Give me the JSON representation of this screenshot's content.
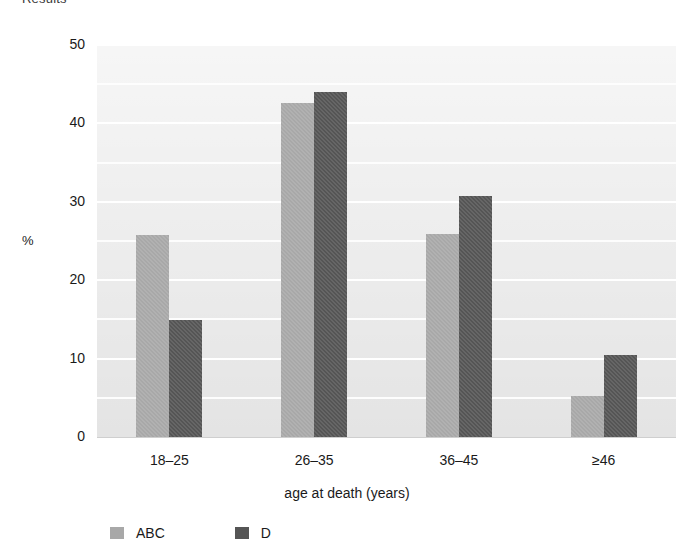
{
  "figure": {
    "heading": "Results"
  },
  "chart_data": {
    "type": "bar",
    "title": "",
    "categories": [
      "18–25",
      "26–35",
      "36–45",
      "≥46"
    ],
    "series": [
      {
        "name": "ABC",
        "color": "#a8a8a8",
        "values": [
          25.8,
          42.6,
          25.9,
          5.2
        ]
      },
      {
        "name": "D",
        "color": "#555555",
        "values": [
          14.9,
          44.0,
          30.7,
          10.5
        ]
      }
    ],
    "xlabel": "age at death (years)",
    "ylabel": "%",
    "ylim": [
      0,
      50
    ],
    "yticks": [
      0,
      10,
      20,
      30,
      40,
      50
    ],
    "ytick_labels": [
      "0",
      "10",
      "20",
      "30",
      "40",
      "50"
    ],
    "minor_gridlines": [
      5,
      15,
      25,
      35,
      45
    ],
    "grid": true,
    "legend_position": "bottom-left",
    "plot_background": "#ececec"
  }
}
